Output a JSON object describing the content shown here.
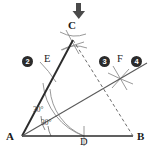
{
  "figure": {
    "type": "geometry-construction-diagram",
    "background_color": "#ffffff",
    "ink_color": "#2b2b2b",
    "construction_color": "#8d8d8d",
    "marker": {
      "name": "down-arrow",
      "glyph": "↓",
      "description": "solid downward arrow pointing at vertex C",
      "x": 79,
      "y": 11
    },
    "vertices": [
      {
        "id": "A",
        "label": "A",
        "x": 22,
        "y": 136,
        "label_x": 6,
        "label_y": 138
      },
      {
        "id": "B",
        "label": "B",
        "x": 133,
        "y": 136,
        "label_x": 137,
        "label_y": 138
      },
      {
        "id": "C",
        "label": "C",
        "x": 73,
        "y": 40,
        "label_x": 68,
        "label_y": 26
      }
    ],
    "points": [
      {
        "id": "D",
        "label": "D",
        "x": 84,
        "y": 136,
        "label_x": 80,
        "label_y": 140
      },
      {
        "id": "E",
        "label": "E",
        "x": 48,
        "y": 71,
        "label_x": 44,
        "label_y": 58
      },
      {
        "id": "F",
        "label": "F",
        "x": 120,
        "y": 78,
        "label_x": 116,
        "label_y": 58
      }
    ],
    "segments": [
      {
        "name": "segment-AB",
        "from": "A",
        "to": "B",
        "style": "solid",
        "weight": 1.6
      },
      {
        "name": "segment-AC",
        "from": "A",
        "to": "C",
        "style": "solid",
        "weight": 1.8
      },
      {
        "name": "segment-CB",
        "from": "C",
        "to": "B",
        "style": "dashed",
        "weight": 1.0
      },
      {
        "name": "ray-AF",
        "from": "A",
        "to": "F",
        "style": "solid",
        "weight": 1.1
      }
    ],
    "angles": [
      {
        "name": "angle-CAF",
        "label": "30°",
        "x": 33,
        "y": 110
      },
      {
        "name": "angle-FAB",
        "label": "30°",
        "x": 40,
        "y": 123
      }
    ],
    "arcs": [
      {
        "name": "compass-arc-from-A",
        "center": "A",
        "radius": 62,
        "start_deg": 198,
        "end_deg": 272,
        "style": "solid"
      }
    ],
    "circled_numbers": [
      {
        "name": "step-marker-2",
        "label": "②",
        "text": "2",
        "x": 27,
        "y": 60
      },
      {
        "name": "step-marker-3",
        "label": "③",
        "text": "3",
        "x": 104,
        "y": 60
      },
      {
        "name": "step-marker-4",
        "label": "④",
        "text": "4",
        "x": 136,
        "y": 60
      }
    ],
    "construction_marks": [
      {
        "name": "arc-cross-at-C",
        "x": 73,
        "y": 42
      },
      {
        "name": "arc-cross-at-F",
        "x": 120,
        "y": 78
      }
    ]
  }
}
